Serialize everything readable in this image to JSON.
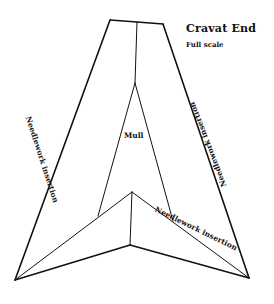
{
  "header": {
    "title": "Cravat End",
    "subtitle": "Full scale"
  },
  "labels": {
    "left_band": "Needlework insertion",
    "right_band": "Needlework insertion",
    "center": "Mull",
    "bottom_band": "Needlework insertion"
  },
  "colors": {
    "line": "#111111",
    "background": "#ffffff"
  },
  "geometry": {
    "outline": [
      [
        110,
        20
      ],
      [
        163,
        24
      ],
      [
        249,
        278
      ],
      [
        130,
        245
      ],
      [
        15,
        280
      ]
    ],
    "top_center": [
      137,
      22
    ],
    "mull_fork": [
      135,
      83
    ],
    "mull_left_foot": [
      98,
      216
    ],
    "mull_right_foot": [
      173,
      221
    ],
    "inner_apex": [
      132,
      192
    ],
    "inner_bottom": [
      130,
      245
    ]
  }
}
